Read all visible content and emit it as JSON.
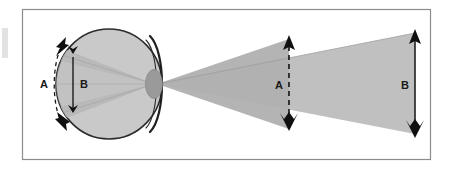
{
  "figure": {
    "kind": "optics-diagram",
    "background_color": "#ffffff",
    "frame": {
      "border_color": "#8c8c8c",
      "border_width": 1,
      "x": 22,
      "y": 9,
      "width": 409,
      "height": 151,
      "fill": "#ffffff"
    },
    "edge_artifact": {
      "color": "#d9d9d9",
      "x": 2,
      "y": 28,
      "width": 6,
      "height": 30
    }
  },
  "colors": {
    "outline": "#1a1a1a",
    "eye_fill": "#c9c9c9",
    "eye_stroke": "#2b2b2b",
    "lens_fill": "#9a9a9a",
    "lens_stroke": "#7d7d7d",
    "ray_cone": "#b4b4b4",
    "ray_cone_inner": "#a8a8a8",
    "label_text": "#1a1a1a",
    "dashed_line": "#1a1a1a",
    "frame_border": "#8c8c8c"
  },
  "eye": {
    "name": "eyeball",
    "center_x": 109,
    "center_y": 84,
    "radius_x": 53,
    "radius_y": 55,
    "cornea_label": "cornea-arc",
    "lens_label": "lens-pupil",
    "lens_center_x": 156,
    "lens_center_y": 84,
    "lens_radius_x": 8,
    "lens_radius_y": 14
  },
  "labels": {
    "retinal_arc": {
      "text": "A",
      "x": 47,
      "y": 88,
      "description": "curved dashed double-headed arrow along the retina, retinal image extent for object A"
    },
    "retinal_line": {
      "text": "B",
      "x": 80,
      "y": 88,
      "description": "straight double-headed arrow inside the eye, retinal image extent for object B"
    },
    "object_near": {
      "text": "A",
      "x": 278,
      "y": 89,
      "description": "near object arrow with dashed shaft"
    },
    "object_far": {
      "text": "B",
      "x": 404,
      "y": 89,
      "description": "far object arrow with solid shaft"
    }
  },
  "objects": [
    {
      "id": "object-A",
      "label": "A",
      "shaft_style": "dashed",
      "x": 289,
      "top_y": 38,
      "bottom_y": 128,
      "height_px": 90,
      "head": "solid-triangle-up",
      "tail": "fletched-barbs"
    },
    {
      "id": "object-B",
      "label": "B",
      "shaft_style": "solid",
      "x": 415,
      "top_y": 32,
      "bottom_y": 135,
      "height_px": 103,
      "head": "solid-triangle-up",
      "tail": "fletched-barbs"
    }
  ],
  "ray_cones": [
    {
      "id": "cone-outside-near",
      "description": "light cone from near object A converging to the lens"
    },
    {
      "id": "cone-outside-far",
      "description": "light cone from far object B converging to the lens"
    },
    {
      "id": "cone-inside-eye",
      "description": "light cone inside the eye diverging from the lens to the retina"
    }
  ],
  "retinal_markers": [
    {
      "id": "retina-extent-A",
      "label": "A",
      "style": "curved-dashed-double-arrow",
      "top_x": 64,
      "top_y": 45,
      "bottom_x": 64,
      "bottom_y": 124
    },
    {
      "id": "retina-extent-B",
      "label": "B",
      "style": "straight-double-arrow",
      "x": 73,
      "top_y": 56,
      "bottom_y": 111
    }
  ]
}
